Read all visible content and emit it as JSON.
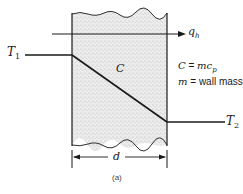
{
  "diagram": {
    "labels": {
      "t1": "T",
      "t1_sub": "1",
      "t2": "T",
      "t2_sub": "2",
      "qh": "q",
      "qh_sub": "h",
      "c_center": "C",
      "c_def_lhs": "C",
      "c_def_eq": " = ",
      "c_def_rhs": "mc",
      "c_def_sub": "p",
      "m_def_lhs": "m",
      "m_def_rhs": " = wall mass",
      "dimension": "d",
      "caption": "(a)"
    },
    "colors": {
      "line": "#1a1a1a",
      "wall_fill": "#e9e9e9"
    }
  }
}
